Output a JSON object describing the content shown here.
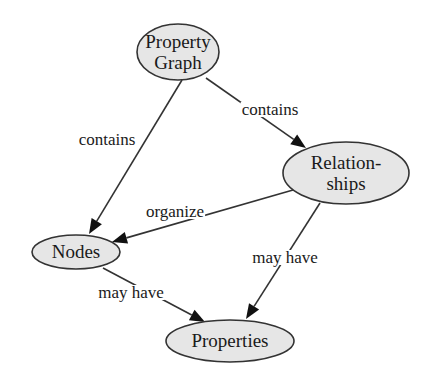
{
  "diagram": {
    "type": "concept-map",
    "nodes": [
      {
        "id": "property_graph",
        "lines": [
          "Property",
          "Graph"
        ]
      },
      {
        "id": "relationships",
        "lines": [
          "Relation-",
          "ships"
        ]
      },
      {
        "id": "nodes",
        "lines": [
          "Nodes"
        ]
      },
      {
        "id": "properties",
        "lines": [
          "Properties"
        ]
      }
    ],
    "edges": [
      {
        "from": "property_graph",
        "to": "nodes",
        "label": "contains"
      },
      {
        "from": "property_graph",
        "to": "relationships",
        "label": "contains"
      },
      {
        "from": "relationships",
        "to": "nodes",
        "label": "organize"
      },
      {
        "from": "relationships",
        "to": "properties",
        "label": "may have"
      },
      {
        "from": "nodes",
        "to": "properties",
        "label": "may have"
      }
    ],
    "colors": {
      "node_fill": "#e6e6e6",
      "stroke": "#333333",
      "text": "#1a1a1a"
    }
  }
}
